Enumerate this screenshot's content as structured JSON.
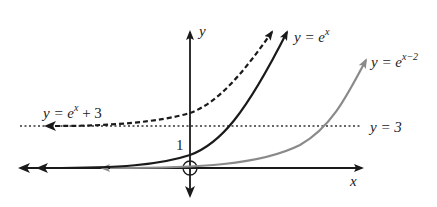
{
  "diagram": {
    "axes": {
      "x_label": "x",
      "y_label": "y",
      "y_intercept_label": "1"
    },
    "curves": [
      {
        "name": "base",
        "label_prefix": "y = e",
        "label_exp": "x",
        "label_suffix": "",
        "style": "solid",
        "color": "#1a1a1a"
      },
      {
        "name": "shift-right-2",
        "label_prefix": "y = e",
        "label_exp": "x−2",
        "label_suffix": "",
        "style": "solid",
        "color": "#8a8a8a"
      },
      {
        "name": "shift-up-3",
        "label_prefix": "y = e",
        "label_exp": "x",
        "label_suffix": " + 3",
        "style": "dashed",
        "color": "#1a1a1a"
      }
    ],
    "asymptote": {
      "label": "y = 3",
      "style": "dotted"
    }
  }
}
